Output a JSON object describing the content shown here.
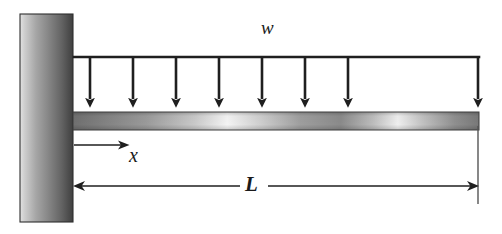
{
  "figure": {
    "type": "engineering-beam-diagram",
    "background_color": "#ffffff"
  },
  "labels": {
    "distributed_load": "w",
    "distance_coordinate": "x",
    "beam_length": "L"
  },
  "wall": {
    "name": "fixed-support-wall",
    "x": 20,
    "y": 14,
    "width": 53,
    "height": 208,
    "gradient_light": "#d8d8d8",
    "gradient_dark": "#4a4a4a",
    "outline_color": "#2b2b2b"
  },
  "beam": {
    "name": "beam-bar",
    "x": 73,
    "y": 112,
    "width": 406,
    "height": 18,
    "gradient_dark": "#6e6e6e",
    "gradient_light": "#f2f2f2",
    "outline_color": "#3a3a3a"
  },
  "load": {
    "name": "distributed-load",
    "bar_y": 57,
    "bar_x_start": 74,
    "bar_x_end": 479,
    "arrow_count": 8,
    "arrow_positions": [
      90,
      133,
      176,
      219,
      262,
      305,
      348,
      478
    ],
    "arrow_tip_y": 108,
    "line_color": "#1f1f1f"
  },
  "dimensions": {
    "x_arrow": {
      "name": "x-distance-arrow",
      "y": 145,
      "x_start": 74,
      "x_end": 127
    },
    "length_dimension": {
      "name": "length-dimension-line",
      "y": 186,
      "x_start": 74,
      "x_end": 478,
      "gap_start": 240,
      "gap_end": 268
    },
    "extension_line": {
      "name": "right-extension-line",
      "x": 478,
      "y_start": 126,
      "y_end": 204
    },
    "line_color": "#1f1f1f"
  }
}
